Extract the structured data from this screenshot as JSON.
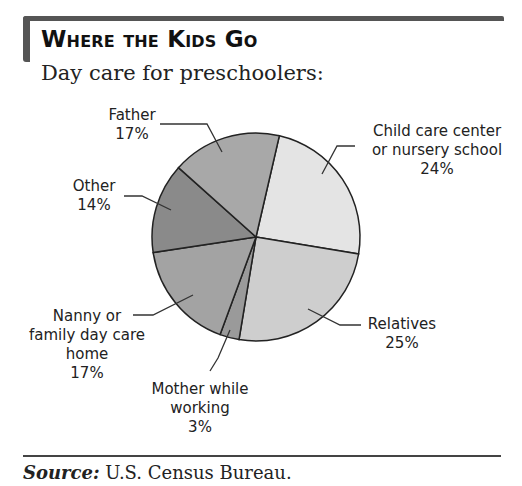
{
  "header": {
    "title": "Where the Kids Go",
    "subtitle": "Day care for preschoolers:"
  },
  "footer": {
    "source_label": "Source:",
    "source_text": " U.S. Census Bureau."
  },
  "labels": {
    "father": {
      "name": "Father",
      "value": "17%"
    },
    "other": {
      "name": "Other",
      "value": "14%"
    },
    "nanny": {
      "line1": "Nanny or",
      "line2": "family day care",
      "line3": "home",
      "value": "17%"
    },
    "mother": {
      "line1": "Mother while",
      "line2": "working",
      "value": "3%"
    },
    "relatives": {
      "name": "Relatives",
      "value": "25%"
    },
    "child": {
      "line1": "Child care center",
      "line2": "or nursery school",
      "value": "24%"
    }
  },
  "chart_data": {
    "type": "pie",
    "title": "Where the Kids Go",
    "subtitle": "Day care for preschoolers:",
    "categories": [
      "Child care center or nursery school",
      "Relatives",
      "Mother while working",
      "Nanny or family day care home",
      "Other",
      "Father"
    ],
    "values": [
      24,
      25,
      3,
      17,
      14,
      17
    ],
    "unit": "%",
    "colors": [
      "#e4e4e4",
      "#cecece",
      "#9a9a9a",
      "#a3a3a3",
      "#8a8a8a",
      "#a8a8a8"
    ],
    "source": "U.S. Census Bureau.",
    "legend": "none (direct labels with leader lines)"
  }
}
